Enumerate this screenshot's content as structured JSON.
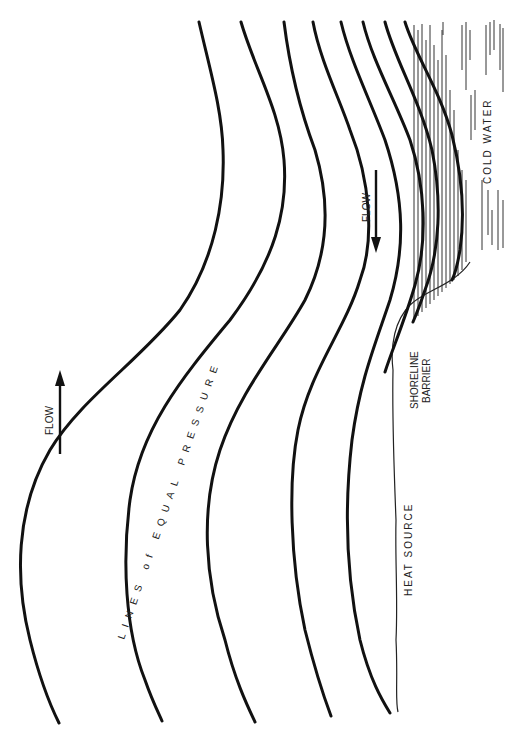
{
  "diagram": {
    "type": "schematic",
    "orientation": "rotated 90 degrees counter-clockwise (text reads bottom-to-top)",
    "labels": {
      "isobars": "LINES of EQUAL PRESSURE",
      "flow_upper_left": "FLOW",
      "flow_right": "FLOW",
      "heat_source": "HEAT SOURCE",
      "shoreline_line1": "SHORELINE",
      "shoreline_line2": "BARRIER",
      "cold_water": "COLD WATER"
    },
    "isobar_count": 8,
    "arrows": [
      {
        "name": "flow-arrow-left",
        "direction": "up",
        "label": "FLOW"
      },
      {
        "name": "flow-arrow-right",
        "direction": "down",
        "label": "FLOW"
      }
    ],
    "colors": {
      "background": "#ffffff",
      "ink": "#111111"
    }
  }
}
